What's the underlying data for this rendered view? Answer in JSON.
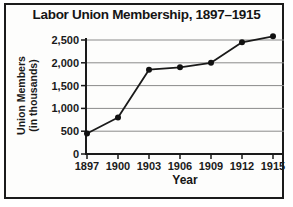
{
  "chart_data": {
    "type": "line",
    "title": "Labor Union Membership, 1897–1915",
    "xlabel": "Year",
    "ylabel": "Union Members (in thousands)",
    "ylabel_lines": [
      "Union Members",
      "(in thousands)"
    ],
    "categories": [
      "1897",
      "1900",
      "1903",
      "1906",
      "1909",
      "1912",
      "1915"
    ],
    "series": [
      {
        "name": "Union members (in thousands)",
        "values": [
          450,
          800,
          1850,
          1900,
          2000,
          2450,
          2580
        ]
      }
    ],
    "ylim": [
      0,
      2500
    ],
    "yticks": [
      0,
      500,
      1000,
      1500,
      2000,
      2500
    ],
    "ytick_labels": [
      "0",
      "500",
      "1,000",
      "1,500",
      "2,000",
      "2,500"
    ],
    "grid": "horizontal-only",
    "legend_position": "none",
    "marker": "filled-circle",
    "colors": {
      "line": "#1a1a1a",
      "marker": "#111111",
      "grid": "#8a8a8a",
      "axis": "#1a1a1a",
      "text": "#1a1a1a",
      "frame_border": "#1b1b1b",
      "background": "#fdfdfc"
    }
  }
}
